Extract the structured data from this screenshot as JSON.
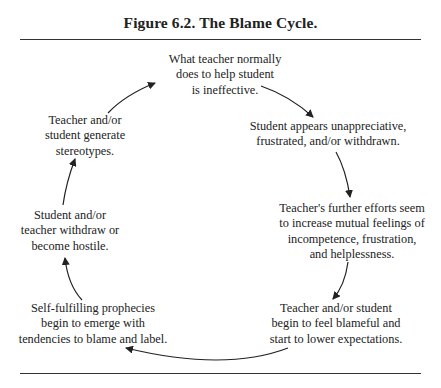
{
  "figure": {
    "title": "Figure 6.2.  The Blame Cycle."
  },
  "nodes": [
    {
      "id": "n1",
      "text": "What teacher normally\ndoes to help student\nis ineffective."
    },
    {
      "id": "n2",
      "text": "Student appears unappreciative,\nfrustrated, and/or withdrawn."
    },
    {
      "id": "n3",
      "text": "Teacher's further efforts seem\nto increase mutual feelings of\nincompetence, frustration,\nand helplessness."
    },
    {
      "id": "n4",
      "text": "Teacher and/or student\nbegin to feel blameful and\nstart to lower expectations."
    },
    {
      "id": "n5",
      "text": "Self-fulfilling prophecies\nbegin to emerge with\ntendencies to blame and label."
    },
    {
      "id": "n6",
      "text": "Student and/or\nteacher withdraw or\nbecome hostile."
    },
    {
      "id": "n7",
      "text": "Teacher and/or\nstudent generate\nstereotypes."
    }
  ],
  "edges": [
    {
      "from": "n1",
      "to": "n2"
    },
    {
      "from": "n2",
      "to": "n3"
    },
    {
      "from": "n3",
      "to": "n4"
    },
    {
      "from": "n4",
      "to": "n5"
    },
    {
      "from": "n5",
      "to": "n6"
    },
    {
      "from": "n6",
      "to": "n7"
    },
    {
      "from": "n7",
      "to": "n1"
    }
  ]
}
